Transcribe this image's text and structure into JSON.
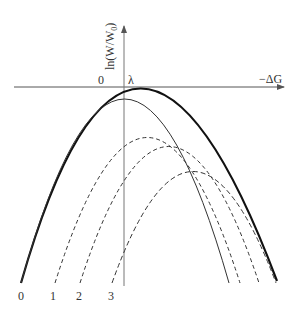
{
  "diagram": {
    "y_axis_label": "ln(W/W",
    "y_axis_subscript": "0",
    "y_axis_close": ")",
    "x_axis_label": "−ΔG",
    "origin_label": "0",
    "lambda_label": "λ",
    "curve_labels": [
      "0",
      "1",
      "2",
      "3"
    ]
  },
  "colors": {
    "line": "#222222",
    "axis": "#555555",
    "text": "#333333"
  }
}
